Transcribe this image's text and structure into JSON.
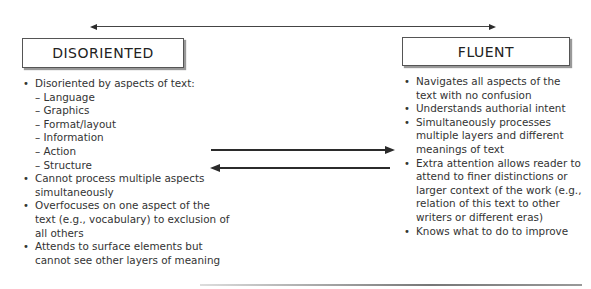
{
  "diagram": {
    "top_arrow": {
      "direction": "bidirectional"
    },
    "left": {
      "title": "DISORIENTED",
      "bullets": [
        {
          "text": "Disoriented by aspects of text:",
          "sub": [
            "– Language",
            "– Graphics",
            "– Format/layout",
            "– Information",
            "– Action",
            "– Structure"
          ]
        },
        {
          "text": "Cannot process multiple aspects simultaneously"
        },
        {
          "text": "Overfocuses on one aspect of the text (e.g., vocabulary) to exclusion of all others"
        },
        {
          "text": "Attends to surface elements but cannot see other layers of meaning"
        }
      ]
    },
    "right": {
      "title": "FLUENT",
      "bullets": [
        {
          "text": "Navigates all aspects of the text with no confusion"
        },
        {
          "text": "Understands authorial intent"
        },
        {
          "text": "Simultaneously processes multiple layers and different meanings of text"
        },
        {
          "text": "Extra attention allows reader to attend to finer distinctions or larger context of the work (e.g., relation of this text to other writers or different eras)"
        },
        {
          "text": "Knows what to do to improve"
        }
      ]
    },
    "middle_arrows": [
      {
        "direction": "right"
      },
      {
        "direction": "left"
      }
    ]
  }
}
